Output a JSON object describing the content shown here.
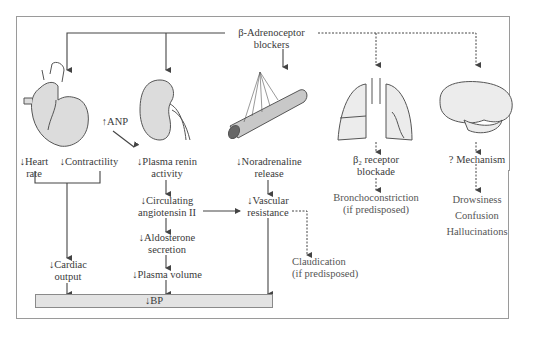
{
  "title": "β-Adrenoceptor blockers",
  "title_line1": "β-Adrenoceptor",
  "title_line2": "blockers",
  "organs": [
    "heart-icon",
    "kidney-icon",
    "blood-vessel-icon",
    "lungs-icon",
    "brain-icon"
  ],
  "heart": {
    "heart_rate_1": "↓Heart",
    "heart_rate_2": "rate",
    "contractility": "↓Contractility",
    "cardiac_output_1": "↓Cardiac",
    "cardiac_output_2": "output"
  },
  "anp": "↑ANP",
  "kidney": {
    "renin_1": "↓Plasma renin",
    "renin_2": "activity",
    "angio_1": "↓Circulating",
    "angio_2": "angiotensin II",
    "aldo_1": "↓Aldosterone",
    "aldo_2": "secretion",
    "plasma_volume": "↓Plasma volume"
  },
  "vessel": {
    "noradrenaline_1": "↓Noradrenaline",
    "noradrenaline_2": "release",
    "vascular_1": "↓Vascular",
    "vascular_2": "resistance",
    "claudication_1": "Claudication",
    "claudication_2": "(if predisposed)"
  },
  "lungs": {
    "receptor_1": "β₂ receptor",
    "receptor_2": "blockade",
    "broncho_1": "Bronchoconstriction",
    "broncho_2": "(if predisposed)"
  },
  "brain": {
    "mechanism": "? Mechanism",
    "effects": [
      "Drowsiness",
      "Confusion",
      "Hallucinations"
    ]
  },
  "bp": "↓BP",
  "colors": {
    "line": "#444444",
    "organ_fill": "#dcdcdc",
    "organ_stroke": "#555555",
    "bar_fill": "#e3e3e3",
    "frame": "#9a9a9a"
  }
}
